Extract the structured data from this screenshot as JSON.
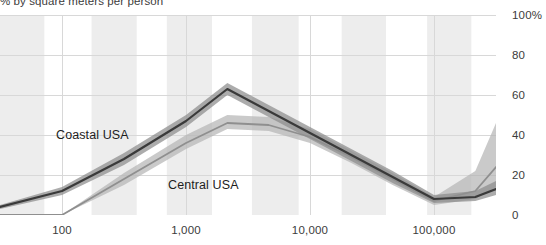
{
  "subtitle": "% by square meters per person",
  "colors": {
    "coastal_line": "#3a3a3a",
    "coastal_band": "#8c8c8c",
    "central_line": "#8f8f8f",
    "central_band": "#b5b5b5",
    "band_stripe": "#ededed",
    "gridline": "#d8d8d8",
    "axis_text": "#3b3b3b",
    "label_text": "#1d1d1d"
  },
  "labels": {
    "coastal": "Coastal USA",
    "central": "Central USA"
  },
  "chart_data": {
    "type": "line",
    "title": "",
    "subtitle": "% by square meters per person",
    "xlabel": "",
    "ylabel": "",
    "xscale": "log",
    "xlim": [
      31.6,
      316228
    ],
    "ylim": [
      0,
      100
    ],
    "grid": true,
    "legend_position": "inline-annotation",
    "x_ticks": [
      100,
      1000,
      10000,
      100000
    ],
    "x_tick_labels": [
      "100",
      "1,000",
      "10,000",
      "100,000"
    ],
    "y_ticks": [
      0,
      20,
      40,
      60,
      80,
      100
    ],
    "y_tick_labels": [
      "0",
      "20",
      "40",
      "60",
      "80",
      "100%"
    ],
    "x": [
      31.6,
      100,
      316,
      1000,
      2154,
      4642,
      10000,
      21544,
      46416,
      100000,
      215443,
      316228
    ],
    "series": [
      {
        "name": "Coastal USA",
        "values": [
          4,
          12,
          28,
          47,
          63,
          52,
          41,
          30,
          19,
          8,
          9,
          13
        ],
        "band_lower": [
          3,
          10,
          25,
          44,
          60,
          49,
          38,
          27,
          16,
          6,
          7,
          10
        ],
        "band_upper": [
          5,
          14,
          31,
          50,
          66,
          55,
          44,
          33,
          22,
          10,
          12,
          17
        ]
      },
      {
        "name": "Central USA",
        "values": [
          0,
          0,
          18,
          36,
          46,
          45,
          39,
          29,
          18,
          7,
          12,
          24
        ],
        "band_lower": [
          0,
          0,
          15,
          33,
          43,
          42,
          36,
          26,
          15,
          5,
          8,
          14
        ],
        "band_upper": [
          0,
          0,
          21,
          40,
          50,
          49,
          43,
          32,
          21,
          9,
          22,
          46
        ]
      }
    ],
    "vertical_stripes": [
      [
        31.6,
        72
      ],
      [
        173,
        400
      ],
      [
        700,
        1620
      ],
      [
        3400,
        8100
      ],
      [
        18000,
        41000
      ],
      [
        88000,
        200000
      ]
    ]
  }
}
